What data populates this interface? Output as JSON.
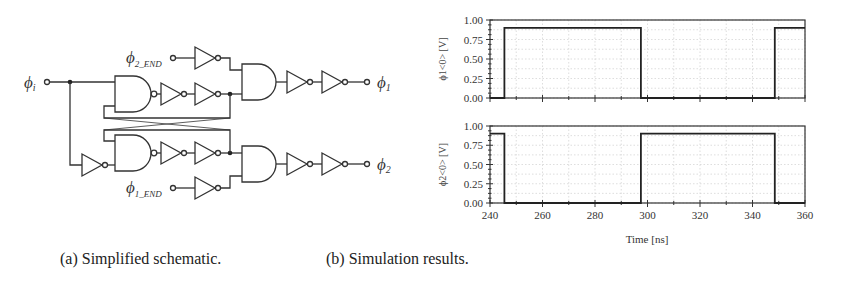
{
  "figure": {
    "panel_a": {
      "caption": "(a) Simplified schematic.",
      "labels": {
        "phi_i": "ϕ",
        "phi_i_sub": "i",
        "phi_2_end": "ϕ",
        "phi_2_end_sub": "2_END",
        "phi_1_end": "ϕ",
        "phi_1_end_sub": "1_END",
        "phi_1": "ϕ",
        "phi_1_sub": "1",
        "phi_2": "ϕ",
        "phi_2_sub": "2"
      },
      "components": [
        "NAND x2 (cross-coupled)",
        "AND x2",
        "inverter x11"
      ]
    },
    "panel_b": {
      "caption": "(b) Simulation results.",
      "xlabel": "Time [ns]",
      "x_ticks": [
        "240",
        "260",
        "280",
        "300",
        "320",
        "340",
        "360"
      ],
      "y_ticks": [
        "1.00",
        "0.75",
        "0.50",
        "0.25",
        "0.00"
      ],
      "plot1_ylabel": "ϕ1<0> [V]",
      "plot2_ylabel": "ϕ2<0> [V]"
    }
  },
  "chart_data": [
    {
      "type": "line",
      "title": "",
      "xlabel": "",
      "ylabel": "ϕ1<0> [V]",
      "xlim": [
        240,
        360
      ],
      "ylim": [
        0,
        1
      ],
      "grid": true,
      "x_ticks": [
        240,
        260,
        280,
        300,
        320,
        340,
        360
      ],
      "y_ticks": [
        0.0,
        0.25,
        0.5,
        0.75,
        1.0
      ],
      "series": [
        {
          "name": "phi1<0>",
          "x": [
            240,
            245.5,
            245.5,
            297.5,
            297.5,
            348.5,
            348.5,
            360
          ],
          "y": [
            0.0,
            0.0,
            0.9,
            0.9,
            0.0,
            0.0,
            0.9,
            0.9
          ]
        }
      ]
    },
    {
      "type": "line",
      "title": "",
      "xlabel": "Time [ns]",
      "ylabel": "ϕ2<0> [V]",
      "xlim": [
        240,
        360
      ],
      "ylim": [
        0,
        1
      ],
      "grid": true,
      "x_ticks": [
        240,
        260,
        280,
        300,
        320,
        340,
        360
      ],
      "y_ticks": [
        0.0,
        0.25,
        0.5,
        0.75,
        1.0
      ],
      "series": [
        {
          "name": "phi2<0>",
          "x": [
            240,
            245.5,
            245.5,
            297.5,
            297.5,
            348.5,
            348.5,
            360
          ],
          "y": [
            0.9,
            0.9,
            0.0,
            0.0,
            0.9,
            0.9,
            0.0,
            0.0
          ]
        }
      ]
    }
  ]
}
